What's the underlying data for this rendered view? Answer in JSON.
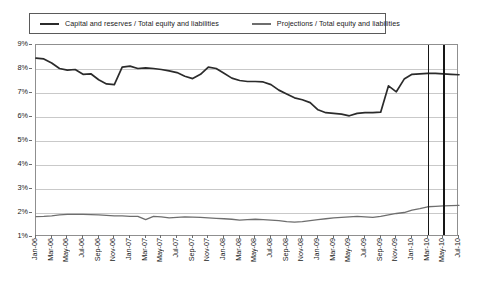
{
  "chart_data": {
    "type": "line",
    "title": "",
    "xlabel": "",
    "ylabel": "",
    "ylim": [
      1,
      9
    ],
    "ytick_labels": [
      "9%",
      "8%",
      "7%",
      "6%",
      "5%",
      "4%",
      "3%",
      "2%",
      "1%"
    ],
    "ytick_values": [
      9,
      8,
      7,
      6,
      5,
      4,
      3,
      2,
      1
    ],
    "grid": true,
    "legend_position": "top",
    "x": [
      "Jan-06",
      "Feb-06",
      "Mar-06",
      "Apr-06",
      "May-06",
      "Jun-06",
      "Jul-06",
      "Aug-06",
      "Sep-06",
      "Oct-06",
      "Nov-06",
      "Dec-06",
      "Jan-07",
      "Feb-07",
      "Mar-07",
      "Apr-07",
      "May-07",
      "Jun-07",
      "Jul-07",
      "Aug-07",
      "Sep-07",
      "Oct-07",
      "Nov-07",
      "Dec-07",
      "Jan-08",
      "Feb-08",
      "Mar-08",
      "Apr-08",
      "May-08",
      "Jun-08",
      "Jul-08",
      "Aug-08",
      "Sep-08",
      "Oct-08",
      "Nov-08",
      "Dec-08",
      "Jan-09",
      "Feb-09",
      "Mar-09",
      "Apr-09",
      "May-09",
      "Jun-09",
      "Jul-09",
      "Aug-09",
      "Sep-09",
      "Oct-09",
      "Nov-09",
      "Dec-09",
      "Jan-10",
      "Feb-10",
      "Mar-10",
      "Apr-10",
      "May-10",
      "Jun-10",
      "Jul-10"
    ],
    "xtick_labels": [
      "Jan-06",
      "Mar-06",
      "May-06",
      "Jul-06",
      "Sep-06",
      "Nov-06",
      "Jan-07",
      "Mar-07",
      "May-07",
      "Jul-07",
      "Sep-07",
      "Nov-07",
      "Jan-08",
      "Mar-08",
      "May-08",
      "Jul-08",
      "Sep-08",
      "Nov-08",
      "Jan-09",
      "Mar-09",
      "May-09",
      "Jul-09",
      "Sep-09",
      "Nov-09",
      "Jan-10",
      "Mar-10",
      "May-10",
      "Jul-10"
    ],
    "series": [
      {
        "name": "Capital and reserves / Total equity and liabilities",
        "color": "#2b2b2b",
        "values": [
          8.45,
          8.42,
          8.25,
          8.02,
          7.95,
          7.98,
          7.78,
          7.8,
          7.55,
          7.38,
          7.35,
          8.08,
          8.12,
          8.02,
          8.05,
          8.02,
          7.98,
          7.92,
          7.85,
          7.7,
          7.6,
          7.78,
          8.08,
          8.02,
          7.82,
          7.62,
          7.52,
          7.48,
          7.48,
          7.46,
          7.35,
          7.12,
          6.96,
          6.8,
          6.72,
          6.6,
          6.3,
          6.18,
          6.15,
          6.12,
          6.05,
          6.15,
          6.18,
          6.18,
          6.2,
          7.3,
          7.05,
          7.58,
          7.78,
          7.8,
          7.82,
          7.82,
          7.8,
          7.78,
          7.76
        ]
      },
      {
        "name": "Projections / Total equity and liabilities",
        "color": "#6e6e6e",
        "values": [
          1.85,
          1.86,
          1.88,
          1.92,
          1.94,
          1.94,
          1.94,
          1.93,
          1.92,
          1.9,
          1.88,
          1.88,
          1.86,
          1.86,
          1.72,
          1.86,
          1.84,
          1.8,
          1.82,
          1.84,
          1.83,
          1.82,
          1.8,
          1.78,
          1.76,
          1.74,
          1.7,
          1.72,
          1.74,
          1.72,
          1.7,
          1.68,
          1.64,
          1.62,
          1.64,
          1.68,
          1.72,
          1.76,
          1.8,
          1.82,
          1.84,
          1.86,
          1.84,
          1.82,
          1.86,
          1.92,
          1.98,
          2.02,
          2.12,
          2.18,
          2.26,
          2.28,
          2.3,
          2.31,
          2.32
        ]
      }
    ],
    "reference_lines": [
      {
        "name": "reference-line-1",
        "x_label": "Mar-10",
        "color": "#161616"
      },
      {
        "name": "reference-line-2",
        "x_label": "May-10",
        "color": "#161616"
      }
    ]
  },
  "legend": {
    "entries": [
      {
        "label": "Capital and reserves / Total equity and liabilities",
        "color": "#2b2b2b"
      },
      {
        "label": "Projections / Total equity and liabilities",
        "color": "#6e6e6e"
      }
    ]
  }
}
